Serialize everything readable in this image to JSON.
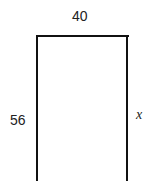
{
  "figure": {
    "shape": "rectangle-open-bottom",
    "labels": {
      "top": "40",
      "left": "56",
      "right": "x"
    },
    "colors": {
      "stroke": "#111111",
      "text": "#222222",
      "background": "#ffffff"
    }
  }
}
